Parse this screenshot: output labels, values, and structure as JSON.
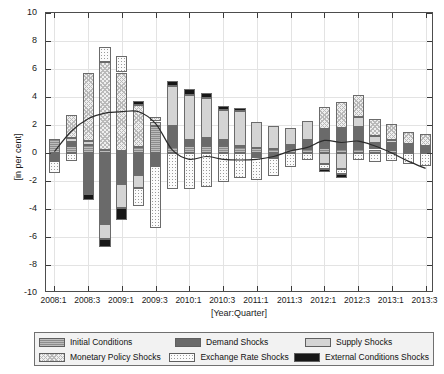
{
  "axes": {
    "ylabel": "[in per cent]",
    "xlabel": "[Year:Quarter]",
    "yticks": [
      "10",
      "8",
      "6",
      "4",
      "2",
      "0",
      "-2",
      "-4",
      "-6",
      "-8",
      "-10"
    ],
    "ylim": [
      -10,
      10
    ],
    "xtick_labels": [
      "2008:1",
      "2008:3",
      "2009:1",
      "2009:3",
      "2010:1",
      "2010:3",
      "2011:1",
      "2011:3",
      "2012:1",
      "2012:3",
      "2013:1",
      "2013:3"
    ],
    "grid": true
  },
  "legend": {
    "items": [
      {
        "label": "Initial Conditions",
        "key": "initial",
        "color": "#8c8c8c",
        "pattern": "horizontal-hatch"
      },
      {
        "label": "Demand Shocks",
        "key": "demand",
        "color": "#6a6a6a",
        "pattern": "solid"
      },
      {
        "label": "Supply Shocks",
        "key": "supply",
        "color": "#d4d4d4",
        "pattern": "solid"
      },
      {
        "label": "Monetary Policy Shocks",
        "key": "monetary",
        "color": "#efefef",
        "pattern": "cross-hatch"
      },
      {
        "label": "Exchange Rate Shocks",
        "key": "exchange",
        "color": "#fbfbfb",
        "pattern": "dotted"
      },
      {
        "label": "External Conditions Shocks",
        "key": "external",
        "color": "#171717",
        "pattern": "solid"
      }
    ]
  },
  "chart_data": {
    "type": "bar",
    "title": "",
    "xlabel": "[Year:Quarter]",
    "ylabel": "[in per cent]",
    "ylim": [
      -10,
      10
    ],
    "grid": true,
    "legend_position": "bottom",
    "stacked": true,
    "categories": [
      "2008:1",
      "2008:2",
      "2008:3",
      "2008:4",
      "2009:1",
      "2009:2",
      "2009:3",
      "2009:4",
      "2010:1",
      "2010:2",
      "2010:3",
      "2010:4",
      "2011:1",
      "2011:2",
      "2011:3",
      "2011:4",
      "2012:1",
      "2012:2",
      "2012:3",
      "2012:4",
      "2013:1",
      "2013:2",
      "2013:3"
    ],
    "series": [
      {
        "name": "Initial Conditions",
        "key": "initial",
        "values": [
          1.0,
          0.5,
          0.6,
          0.2,
          0.15,
          0.4,
          1.9,
          0.45,
          0.5,
          0.5,
          0.5,
          0.4,
          0.35,
          0.3,
          0.3,
          0.3,
          0.35,
          0.3,
          0.3,
          0.25,
          0.2,
          0.15,
          0.1
        ]
      },
      {
        "name": "Demand Shocks",
        "key": "demand",
        "values": [
          -0.55,
          0.3,
          -2.9,
          -5.1,
          -2.2,
          -1.6,
          -0.95,
          1.45,
          0.45,
          0.6,
          0.45,
          0.1,
          -0.3,
          -0.35,
          0.25,
          0.6,
          1.35,
          1.5,
          1.55,
          0.45,
          0.5,
          0.35,
          0.3
        ]
      },
      {
        "name": "Supply Shocks",
        "key": "supply",
        "values": [
          0.0,
          0.25,
          0.25,
          -1.05,
          -1.75,
          -0.9,
          0.35,
          2.9,
          3.2,
          2.85,
          2.15,
          2.5,
          1.85,
          1.6,
          1.25,
          1.4,
          -0.75,
          -1.15,
          0.75,
          0.5,
          0.25,
          0.15,
          0.1
        ]
      },
      {
        "name": "Monetary Policy Shocks",
        "key": "monetary",
        "values": [
          0.0,
          1.65,
          4.9,
          6.3,
          5.6,
          3.0,
          0.3,
          0.0,
          0.0,
          0.0,
          0.0,
          0.0,
          0.0,
          0.0,
          0.0,
          0.0,
          1.6,
          1.85,
          1.55,
          1.2,
          1.15,
          0.85,
          0.85
        ]
      },
      {
        "name": "Exchange Rate Shocks",
        "key": "exchange",
        "values": [
          -0.9,
          -0.6,
          0.0,
          1.1,
          1.15,
          -1.25,
          -4.4,
          -2.55,
          -2.6,
          -2.4,
          -2.1,
          -1.8,
          -1.65,
          -1.3,
          -1.0,
          -0.5,
          -0.4,
          -0.35,
          -0.5,
          -0.65,
          -0.55,
          -0.8,
          -0.95
        ]
      },
      {
        "name": "External Conditions Shocks",
        "key": "external",
        "values": [
          0.0,
          0.0,
          -0.45,
          -0.6,
          -0.85,
          0.35,
          0.0,
          0.35,
          0.4,
          0.35,
          0.25,
          0.2,
          0.0,
          0.0,
          0.0,
          0.0,
          -0.2,
          -0.25,
          0.0,
          0.0,
          0.0,
          0.0,
          0.0
        ]
      }
    ],
    "line_series": {
      "name": "Total",
      "values": [
        0.1,
        1.55,
        2.45,
        2.85,
        2.95,
        2.95,
        2.1,
        0.2,
        -0.45,
        -0.25,
        -0.45,
        -0.5,
        -0.45,
        -0.25,
        0.15,
        0.4,
        0.9,
        0.75,
        0.85,
        0.5,
        0.0,
        -0.6,
        -1.1
      ]
    }
  }
}
